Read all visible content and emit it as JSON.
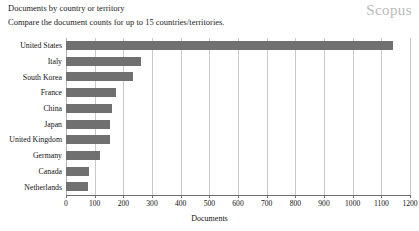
{
  "header": {
    "title": "Documents by country or territory",
    "subtitle": "Compare the document counts for up to 15 countries/territories.",
    "brand": "Scopus"
  },
  "chart_data": {
    "type": "bar",
    "orientation": "horizontal",
    "title": "Documents by country or territory",
    "subtitle": "Compare the document counts for up to 15 countries/territories.",
    "xlabel": "Documents",
    "ylabel": "",
    "categories": [
      "United States",
      "Italy",
      "South Korea",
      "France",
      "China",
      "Japan",
      "United Kingdom",
      "Germany",
      "Canada",
      "Netherlands"
    ],
    "values": [
      1139,
      261,
      233,
      174,
      160,
      153,
      152,
      120,
      80,
      78
    ],
    "xlim": [
      0,
      1200
    ],
    "xticks": [
      0,
      100,
      200,
      300,
      400,
      500,
      600,
      700,
      800,
      900,
      1000,
      1100,
      1200
    ],
    "xtick_labels": [
      "0",
      "100",
      "200",
      "300",
      "400",
      "500",
      "600",
      "700",
      "800",
      "900",
      "1000",
      "1100",
      "1200"
    ],
    "grid": true,
    "grid_axis": "x",
    "legend": false,
    "bar_color": "#707070",
    "grid_color": "#c9c9c9",
    "axis_color": "#6f6f6f",
    "background_color": "#ffffff"
  }
}
